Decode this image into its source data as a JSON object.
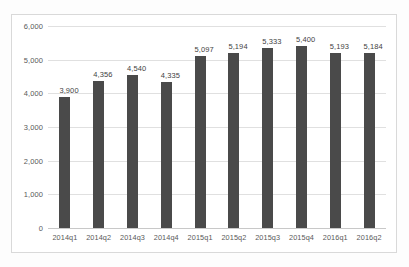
{
  "chart_data": {
    "type": "bar",
    "title": "",
    "subtitle": "",
    "xlabel": "",
    "ylabel": "",
    "categories": [
      "2014q1",
      "2014q2",
      "2014q3",
      "2014q4",
      "2015q1",
      "2015q2",
      "2015q3",
      "2015q4",
      "2016q1",
      "2016q2"
    ],
    "values": [
      3900,
      4356,
      4540,
      4335,
      5097,
      5194,
      5333,
      5400,
      5193,
      5184
    ],
    "value_labels": [
      "3,900",
      "4,356",
      "4,540",
      "4,335",
      "5,097",
      "5,194",
      "5,333",
      "5,400",
      "5,193",
      "5,184"
    ],
    "ylim": [
      0,
      6000
    ],
    "ytick_values": [
      0,
      1000,
      2000,
      3000,
      4000,
      5000,
      6000
    ],
    "ytick_labels": [
      "0",
      "1,000",
      "2,000",
      "3,000",
      "4,000",
      "5,000",
      "6,000"
    ],
    "grid": true,
    "legend": false,
    "legend_position": "none",
    "bar_color": "#4a4a4a",
    "gridline_color": "#e0e0e0",
    "plot_background": "#ffffff",
    "border_color": "#d9d9d9"
  }
}
